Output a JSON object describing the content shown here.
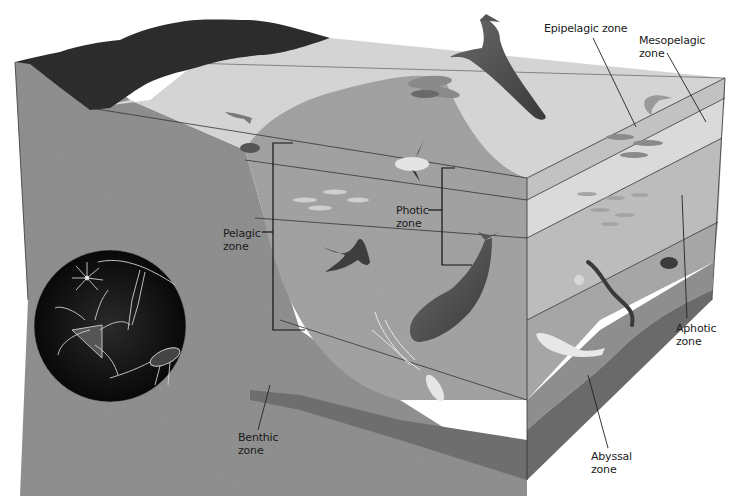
{
  "diagram": {
    "type": "ocean-zones-cross-section",
    "colors": {
      "background": "#ffffff",
      "land": "#2a2a2a",
      "shallow_water_surface": "#d2d2d2",
      "pelagic_water": "#9a9a9a",
      "benthic_slope": "#8a8a8a",
      "front_face_epipelagic": "#c4c4c4",
      "front_face_mesopelagic": "#d6d6d6",
      "aphotic_face": "#b8b8b8",
      "abyssal_face": "#8e8e8e",
      "seafloor": "#6e6e6e",
      "plankton_inset": "#111111",
      "label_text": "#1a1a1a",
      "leader_line": "#222222"
    },
    "labels": {
      "epipelagic": "Epipelagic zone",
      "mesopelagic": "Mesopelagic\nzone",
      "photic": "Photic\nzone",
      "pelagic": "Pelagic\nzone",
      "aphotic": "Aphotic\nzone",
      "benthic": "Benthic\nzone",
      "abyssal": "Abyssal\nzone"
    },
    "organisms": [
      "humpback-whale",
      "dolphins",
      "shark",
      "sea-turtle",
      "ocean-sunfish",
      "fish-school-shallow",
      "manta-ray",
      "sperm-whale",
      "giant-squid",
      "tuna-school",
      "leaping-fish",
      "fish-school-mid",
      "gulper-eel",
      "anglerfish",
      "beluga-whale",
      "plankton-inset"
    ]
  }
}
